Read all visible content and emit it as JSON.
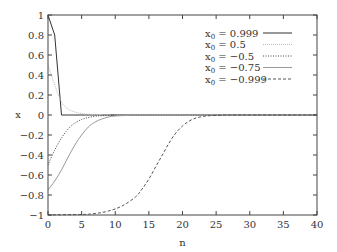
{
  "chart_data": {
    "type": "line",
    "title": "",
    "xlabel": "n",
    "ylabel": "x",
    "xlim": [
      0,
      40
    ],
    "ylim": [
      -1,
      1
    ],
    "xticks": [
      "0",
      "5",
      "10",
      "15",
      "20",
      "25",
      "30",
      "35",
      "40"
    ],
    "yticks": [
      "1",
      "0.8",
      "0.6",
      "0.4",
      "0.2",
      "0",
      "-0.2",
      "-0.4",
      "-0.6",
      "-0.8",
      "-1"
    ],
    "grid": false,
    "legend_position": "upper right",
    "series": [
      {
        "name": "x0 = 0.999",
        "x0": "0.999",
        "style": "solid",
        "color": "#333333",
        "x": [
          0,
          1,
          2,
          3,
          40
        ],
        "y": [
          0.999,
          0.8,
          0.0,
          0.0,
          0.0
        ]
      },
      {
        "name": "x0 = 0.5",
        "x0": "0.5",
        "style": "dotted-light",
        "color": "#bbbbbb",
        "x": [
          0,
          1,
          2,
          3,
          4,
          5,
          6,
          8,
          10,
          40
        ],
        "y": [
          0.5,
          0.3,
          0.13,
          0.06,
          0.03,
          0.015,
          0.007,
          0.002,
          0.0,
          0.0
        ]
      },
      {
        "name": "x0 = -0.5",
        "x0": "-0.5",
        "style": "dotted",
        "color": "#555555",
        "x": [
          0,
          1,
          2,
          3,
          4,
          5,
          6,
          7,
          8,
          10,
          12,
          40
        ],
        "y": [
          -0.5,
          -0.35,
          -0.23,
          -0.14,
          -0.08,
          -0.045,
          -0.025,
          -0.013,
          -0.007,
          -0.002,
          0.0,
          0.0
        ]
      },
      {
        "name": "x0 = -0.75",
        "x0": "-0.75",
        "style": "solid-light",
        "color": "#999999",
        "x": [
          0,
          1,
          2,
          3,
          4,
          5,
          6,
          7,
          8,
          9,
          10,
          12,
          14,
          40
        ],
        "y": [
          -0.75,
          -0.66,
          -0.55,
          -0.42,
          -0.3,
          -0.2,
          -0.12,
          -0.07,
          -0.04,
          -0.02,
          -0.01,
          -0.003,
          0.0,
          0.0
        ]
      },
      {
        "name": "x0 = -0.999",
        "x0": "-0.999",
        "style": "dashed",
        "color": "#666666",
        "x": [
          0,
          5,
          7,
          9,
          11,
          13,
          14,
          15,
          16,
          17,
          18,
          19,
          20,
          21,
          22,
          23,
          24,
          26,
          28,
          40
        ],
        "y": [
          -0.999,
          -0.995,
          -0.985,
          -0.96,
          -0.91,
          -0.82,
          -0.74,
          -0.64,
          -0.52,
          -0.4,
          -0.28,
          -0.18,
          -0.11,
          -0.06,
          -0.03,
          -0.015,
          -0.007,
          -0.002,
          0.0,
          0.0
        ]
      }
    ]
  },
  "legend": {
    "prefix": "x",
    "sub": "0",
    "items": [
      {
        "value": "0.999"
      },
      {
        "value": "0.5"
      },
      {
        "value": "−0.5"
      },
      {
        "value": "−0.75"
      },
      {
        "value": "−0.999"
      }
    ]
  }
}
